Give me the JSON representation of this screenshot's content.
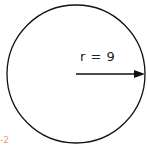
{
  "diagram": {
    "shape": "circle",
    "radius_label": "r = 9",
    "corner_label": "-2",
    "stroke_color": "#111111",
    "corner_label_color": "#e8a060"
  }
}
